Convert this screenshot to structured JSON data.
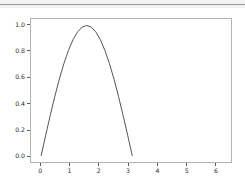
{
  "window": {
    "toolbar_divider": "horizontal-rule",
    "band_color": "#f2f2f2",
    "rule_color": "#9a9a9a"
  },
  "chart_data": {
    "type": "line",
    "title": "",
    "xlabel": "",
    "ylabel": "",
    "xlim": [
      -0.35,
      6.55
    ],
    "ylim": [
      -0.05,
      1.05
    ],
    "grid": false,
    "legend": null,
    "line_color": "#555555",
    "line_width": 1,
    "xticks": [
      0,
      1,
      2,
      3,
      4,
      5,
      6
    ],
    "xtick_labels": [
      "0",
      "1",
      "2",
      "3",
      "4",
      "5",
      "6"
    ],
    "yticks": [
      0.0,
      0.2,
      0.4,
      0.6,
      0.8,
      1.0
    ],
    "ytick_labels": [
      "0.0",
      "0.2",
      "0.4",
      "0.6",
      "0.8",
      "1.0"
    ],
    "series": [
      {
        "name": "sin(x)",
        "description": "half sine arch rising from 0 at x=0 to peak 1.0 at x=1.571 and back to 0 at x=3.142",
        "x": [
          0.0,
          0.157,
          0.314,
          0.471,
          0.628,
          0.785,
          0.942,
          1.1,
          1.257,
          1.414,
          1.571,
          1.728,
          1.885,
          2.042,
          2.199,
          2.356,
          2.513,
          2.67,
          2.827,
          2.985,
          3.142
        ],
        "y": [
          0.0,
          0.156,
          0.309,
          0.454,
          0.588,
          0.707,
          0.809,
          0.891,
          0.951,
          0.988,
          1.0,
          0.988,
          0.951,
          0.891,
          0.809,
          0.707,
          0.588,
          0.454,
          0.309,
          0.156,
          0.0
        ]
      }
    ],
    "peak": {
      "x": 1.571,
      "y": 1.0
    },
    "zero_crossings": [
      0.0,
      3.142
    ],
    "axes_color": "#b4b4b4",
    "tick_color": "#5a5a5a",
    "background": "#ffffff"
  }
}
